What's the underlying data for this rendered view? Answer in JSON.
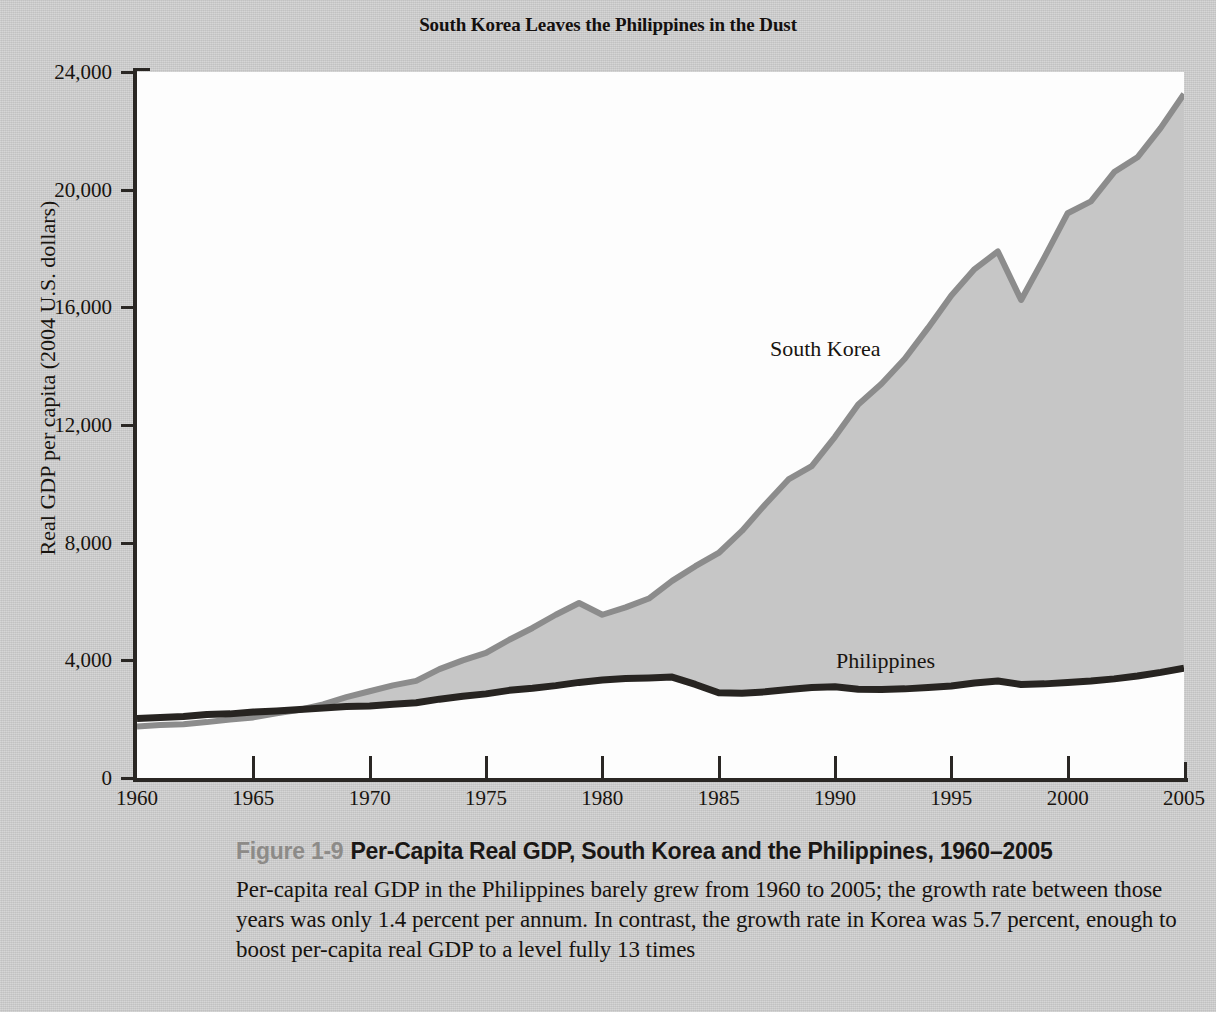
{
  "chart_title": "South Korea Leaves the Philippines in the Dust",
  "axes": {
    "ylabel": "Real GDP per capita (2004 U.S. dollars)",
    "xlabel": "",
    "yticks": [
      "0",
      "4,000",
      "8,000",
      "12,000",
      "16,000",
      "20,000",
      "24,000"
    ],
    "xticks": [
      "1960",
      "1965",
      "1970",
      "1975",
      "1980",
      "1985",
      "1990",
      "1995",
      "2000",
      "2005"
    ]
  },
  "series_labels": {
    "korea": "South Korea",
    "philippines": "Philippines"
  },
  "colors": {
    "fill": "#c6c6c6",
    "korea_line": "#8c8c8c",
    "philippines_line": "#272421",
    "page_bg": "#cdcdcd",
    "plot_bg": "#fdfdfd",
    "axis": "#2a2724",
    "fignum": "#8d8b88"
  },
  "caption": {
    "figure_number": "Figure 1-9",
    "title": "Per-Capita Real GDP, South Korea and the Philippines, 1960–2005",
    "body": "Per-capita real GDP in the Philippines barely grew from 1960 to 2005; the growth rate between those years was only 1.4 percent per annum. In contrast, the growth rate in Korea was 5.7 percent, enough to boost per-capita real GDP to a level fully 13 times"
  },
  "chart_data": {
    "type": "area",
    "title": "South Korea Leaves the Philippines in the Dust",
    "xlabel": "",
    "ylabel": "Real GDP per capita (2004 U.S. dollars)",
    "xlim": [
      1960,
      2005
    ],
    "ylim": [
      0,
      24000
    ],
    "grid": false,
    "legend": "inline-annotations",
    "x": [
      1960,
      1961,
      1962,
      1963,
      1964,
      1965,
      1966,
      1967,
      1968,
      1969,
      1970,
      1971,
      1972,
      1973,
      1974,
      1975,
      1976,
      1977,
      1978,
      1979,
      1980,
      1981,
      1982,
      1983,
      1984,
      1985,
      1986,
      1987,
      1988,
      1989,
      1990,
      1991,
      1992,
      1993,
      1994,
      1995,
      1996,
      1997,
      1998,
      1999,
      2000,
      2001,
      2002,
      2003,
      2004,
      2005
    ],
    "series": [
      {
        "name": "South Korea",
        "values": [
          1750,
          1800,
          1830,
          1900,
          1990,
          2060,
          2200,
          2320,
          2500,
          2750,
          2950,
          3150,
          3300,
          3700,
          4000,
          4250,
          4700,
          5100,
          5550,
          5950,
          5550,
          5800,
          6100,
          6700,
          7200,
          7650,
          8400,
          9300,
          10150,
          10600,
          11600,
          12700,
          13400,
          14250,
          15300,
          16400,
          17300,
          17900,
          16250,
          17700,
          19200,
          19600,
          20600,
          21100,
          22100,
          23250
        ]
      },
      {
        "name": "Philippines",
        "values": [
          2020,
          2060,
          2090,
          2160,
          2180,
          2240,
          2280,
          2330,
          2380,
          2430,
          2450,
          2510,
          2560,
          2680,
          2780,
          2860,
          2980,
          3050,
          3140,
          3250,
          3330,
          3380,
          3400,
          3430,
          3180,
          2900,
          2880,
          2930,
          3010,
          3080,
          3100,
          3020,
          3010,
          3030,
          3080,
          3130,
          3230,
          3300,
          3180,
          3200,
          3250,
          3300,
          3370,
          3470,
          3590,
          3730
        ]
      }
    ]
  }
}
